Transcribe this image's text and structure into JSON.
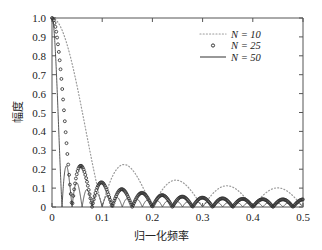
{
  "chart_data": {
    "type": "line",
    "title": "",
    "xlabel": "归一化频率",
    "ylabel": "幅度",
    "xlim": [
      0,
      0.5
    ],
    "ylim": [
      0,
      1.0
    ],
    "xticks": [
      "0",
      "0.1",
      "0.2",
      "0.3",
      "0.4",
      "0.5"
    ],
    "xtick_values": [
      0,
      0.1,
      0.2,
      0.3,
      0.4,
      0.5
    ],
    "yticks": [
      "0",
      "0.1",
      "0.2",
      "0.3",
      "0.4",
      "0.5",
      "0.6",
      "0.7",
      "0.8",
      "0.9",
      "1.0"
    ],
    "ytick_values": [
      0,
      0.1,
      0.2,
      0.3,
      0.4,
      0.5,
      0.6,
      0.7,
      0.8,
      0.9,
      1.0
    ],
    "grid": false,
    "legend_position": "upper right",
    "series": [
      {
        "name": "N = 10",
        "label_n": "10",
        "style": "dotted",
        "color": "#9a9a9a",
        "linewidth": 1.2,
        "N": 10,
        "description": "Magnitude of Dirichlet kernel |sin(pi f N)/(N sin(pi f))| for N = 10; main lobe null near f = 0.20, sidelobe peak about 0.22 near f = 0.29, value about 0.13 at f = 0.5",
        "x": [
          0,
          0.01,
          0.02,
          0.03,
          0.04,
          0.05,
          0.06,
          0.07,
          0.08,
          0.09,
          0.1,
          0.11,
          0.12,
          0.13,
          0.14,
          0.15,
          0.16,
          0.17,
          0.18,
          0.19,
          0.2,
          0.21,
          0.22,
          0.23,
          0.24,
          0.25,
          0.26,
          0.27,
          0.28,
          0.29,
          0.3,
          0.31,
          0.32,
          0.33,
          0.34,
          0.35,
          0.36,
          0.37,
          0.38,
          0.39,
          0.4,
          0.41,
          0.42,
          0.43,
          0.44,
          0.45,
          0.46,
          0.47,
          0.48,
          0.49,
          0.5
        ],
        "y": [
          1.0,
          0.984,
          0.936,
          0.861,
          0.765,
          0.656,
          0.541,
          0.428,
          0.322,
          0.228,
          0.147,
          0.081,
          0.029,
          0.01,
          0.039,
          0.059,
          0.072,
          0.078,
          0.078,
          0.072,
          0.06,
          0.044,
          0.024,
          0.0,
          0.026,
          0.054,
          0.082,
          0.109,
          0.134,
          0.155,
          0.172,
          0.183,
          0.189,
          0.189,
          0.183,
          0.171,
          0.153,
          0.131,
          0.104,
          0.074,
          0.042,
          0.009,
          0.025,
          0.058,
          0.09,
          0.119,
          0.144,
          0.165,
          0.18,
          0.189,
          0.19
        ]
      },
      {
        "name": "N = 25",
        "label_n": "25",
        "style": "circles",
        "color": "#333333",
        "linewidth": 2.0,
        "marker": "circle-open",
        "N": 25,
        "description": "Magnitude of Dirichlet kernel for N = 25; main lobe null near f = 0.08, sidelobes peaking about 0.21 at f = 0.11 then decaying; drawn with small open circle markers",
        "x": [
          0,
          0.01,
          0.02,
          0.03,
          0.04,
          0.05,
          0.06,
          0.07,
          0.08,
          0.09,
          0.1,
          0.11,
          0.12,
          0.13,
          0.14,
          0.15,
          0.16,
          0.17,
          0.18,
          0.19,
          0.2,
          0.21,
          0.22,
          0.23,
          0.24,
          0.25,
          0.26,
          0.27,
          0.28,
          0.29,
          0.3,
          0.31,
          0.32,
          0.33,
          0.34,
          0.35,
          0.36,
          0.37,
          0.38,
          0.39,
          0.4,
          0.41,
          0.42,
          0.43,
          0.44,
          0.45,
          0.46,
          0.47,
          0.48,
          0.49,
          0.5
        ],
        "y": [
          1.0,
          0.902,
          0.65,
          0.35,
          0.11,
          0.03,
          0.12,
          0.14,
          0.02,
          0.1,
          0.19,
          0.21,
          0.16,
          0.07,
          0.03,
          0.12,
          0.18,
          0.18,
          0.12,
          0.03,
          0.05,
          0.14,
          0.19,
          0.18,
          0.11,
          0.01,
          0.09,
          0.17,
          0.2,
          0.16,
          0.07,
          0.03,
          0.13,
          0.19,
          0.19,
          0.13,
          0.03,
          0.07,
          0.16,
          0.2,
          0.17,
          0.09,
          0.01,
          0.11,
          0.19,
          0.2,
          0.15,
          0.06,
          0.05,
          0.14,
          0.2
        ]
      },
      {
        "name": "N = 50",
        "label_n": "50",
        "style": "solid",
        "color": "#444444",
        "linewidth": 0.9,
        "N": 50,
        "description": "Magnitude of Dirichlet kernel for N = 50; main lobe null near f = 0.04, first sidelobe peak about 0.21 at f = 0.055, subsequent sidelobes near 0.09-0.13",
        "x": [
          0,
          0.005,
          0.01,
          0.015,
          0.02,
          0.025,
          0.03,
          0.035,
          0.04,
          0.045,
          0.05,
          0.055,
          0.06,
          0.065,
          0.07,
          0.075,
          0.08,
          0.085,
          0.09,
          0.095,
          0.1,
          0.11,
          0.12,
          0.13,
          0.14,
          0.15,
          0.16,
          0.17,
          0.18,
          0.19,
          0.2,
          0.21,
          0.22,
          0.23,
          0.24,
          0.25,
          0.26,
          0.27,
          0.28,
          0.29,
          0.3,
          0.31,
          0.32,
          0.33,
          0.34,
          0.35,
          0.36,
          0.37,
          0.38,
          0.39,
          0.4,
          0.41,
          0.42,
          0.43,
          0.44,
          0.45,
          0.46,
          0.47,
          0.48,
          0.49,
          0.5
        ],
        "y": [
          1.0,
          0.96,
          0.86,
          0.69,
          0.49,
          0.29,
          0.12,
          0.02,
          0.0,
          0.13,
          0.2,
          0.21,
          0.17,
          0.09,
          0.01,
          0.06,
          0.0,
          0.08,
          0.12,
          0.13,
          0.1,
          0.02,
          0.12,
          0.13,
          0.08,
          0.0,
          0.09,
          0.13,
          0.1,
          0.02,
          0.06,
          0.12,
          0.12,
          0.06,
          0.02,
          0.1,
          0.13,
          0.09,
          0.01,
          0.07,
          0.12,
          0.11,
          0.05,
          0.03,
          0.11,
          0.13,
          0.08,
          0.0,
          0.09,
          0.12,
          0.1,
          0.03,
          0.06,
          0.12,
          0.11,
          0.05,
          0.03,
          0.11,
          0.12,
          0.07,
          0.01
        ]
      }
    ]
  },
  "axes": {
    "y_label": "幅度",
    "x_label": "归一化频率"
  },
  "legend": {
    "entries": [
      {
        "label": "N = 10",
        "style": "dotted"
      },
      {
        "label": "N = 25",
        "style": "circles"
      },
      {
        "label": "N = 50",
        "style": "solid"
      }
    ]
  },
  "colors": {
    "axis": "#555555",
    "text": "#222222",
    "series_n10": "#9a9a9a",
    "series_n25": "#333333",
    "series_n50": "#444444",
    "background": "#ffffff"
  }
}
